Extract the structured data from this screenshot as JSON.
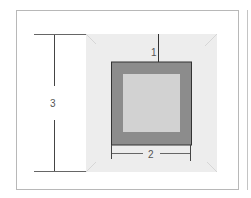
{
  "diagram": {
    "type": "dimensioned-square-frame",
    "labels": {
      "dim1": "1",
      "dim2": "2",
      "dim3": "3"
    },
    "colors": {
      "background_panel": "#ececec",
      "outer_frame_fill": "#8c8c8c",
      "outer_frame_stroke": "#333333",
      "inner_square_fill": "#d2d2d2",
      "dimension_line": "#555555",
      "border": "#b8b8b8"
    }
  }
}
